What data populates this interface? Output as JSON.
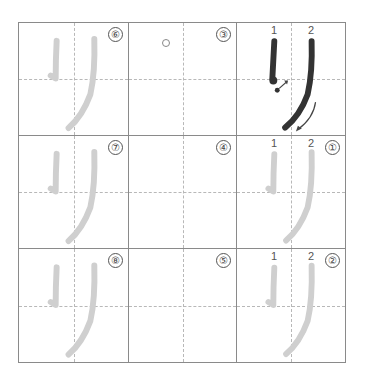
{
  "worksheet": {
    "character": "り",
    "colors": {
      "grid_line": "#8a8a8a",
      "guide_line": "#b8b8b8",
      "model_stroke": "#333333",
      "trace_stroke": "#cfcfcf",
      "label_text": "#444444"
    },
    "cells": [
      {
        "row": 0,
        "col": 0,
        "number": "⑥",
        "type": "trace"
      },
      {
        "row": 0,
        "col": 1,
        "number": "③",
        "type": "blank-start-marker"
      },
      {
        "row": 0,
        "col": 2,
        "number": "",
        "type": "model",
        "stroke_labels": [
          "1",
          "2"
        ]
      },
      {
        "row": 1,
        "col": 0,
        "number": "⑦",
        "type": "trace"
      },
      {
        "row": 1,
        "col": 1,
        "number": "④",
        "type": "blank"
      },
      {
        "row": 1,
        "col": 2,
        "number": "①",
        "type": "trace",
        "stroke_labels": [
          "1",
          "2"
        ]
      },
      {
        "row": 2,
        "col": 0,
        "number": "⑧",
        "type": "trace"
      },
      {
        "row": 2,
        "col": 1,
        "number": "⑤",
        "type": "blank"
      },
      {
        "row": 2,
        "col": 2,
        "number": "②",
        "type": "trace",
        "stroke_labels": [
          "1",
          "2"
        ]
      }
    ]
  }
}
